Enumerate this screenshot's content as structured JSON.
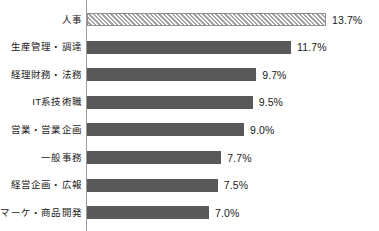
{
  "chart_data": {
    "type": "bar",
    "orientation": "horizontal",
    "title": "",
    "subtitle": "",
    "xlabel": "",
    "ylabel": "",
    "grid": false,
    "legend": null,
    "axis_origin": 0,
    "xlim": [
      0,
      16
    ],
    "value_suffix": "%",
    "categories": [
      "人事",
      "生産管理・調達",
      "経理財務・法務",
      "IT系技術職",
      "営業・営業企画",
      "一般事務",
      "経営企画・広報",
      "マーケ・商品開発"
    ],
    "values": [
      13.7,
      11.7,
      9.7,
      9.5,
      9.0,
      7.7,
      7.5,
      7.0
    ],
    "value_labels": [
      "13.7%",
      "11.7%",
      "9.7%",
      "9.5%",
      "9.0%",
      "7.7%",
      "7.5%",
      "7.0%"
    ],
    "bar_styles": [
      "hatched",
      "solid",
      "solid",
      "solid",
      "solid",
      "solid",
      "solid",
      "solid"
    ],
    "colors": {
      "bar_solid": "#595959",
      "bar_highlight_fill": "#c9c9c9",
      "bar_highlight_hatch": "#a5a5a5",
      "bar_highlight_border": "#8f8f8f",
      "axis": "#9a9a9a",
      "text": "#1a1a1a",
      "background": "#ffffff"
    }
  }
}
